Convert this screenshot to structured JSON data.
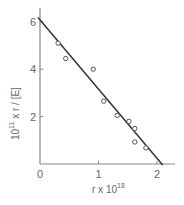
{
  "chart_data": {
    "type": "scatter",
    "title": "",
    "xlabel": "r x 10^18",
    "xlabel_main": "r x 10",
    "xlabel_sup": "18",
    "ylabel": "10^11 x r / [E]",
    "ylabel_pre": "10",
    "ylabel_sup": "11",
    "ylabel_post": " x r / [E]",
    "xlim": [
      0,
      2.3
    ],
    "ylim": [
      0,
      6.4
    ],
    "x_ticks": [
      0,
      1,
      2
    ],
    "x_tick_labels": [
      "0",
      "1",
      "2"
    ],
    "y_ticks": [
      2,
      4,
      6
    ],
    "y_tick_labels": [
      "2",
      "4",
      "6"
    ],
    "grid": false,
    "legend": null,
    "series": [
      {
        "name": "data",
        "marker": "open-circle",
        "x": [
          0.31,
          0.44,
          0.91,
          1.09,
          1.32,
          1.52,
          1.62,
          1.62,
          1.81
        ],
        "y": [
          5.1,
          4.45,
          4.0,
          2.65,
          2.05,
          1.8,
          1.5,
          0.93,
          0.68
        ]
      },
      {
        "name": "fit",
        "type": "line",
        "x": [
          0,
          2.08
        ],
        "y": [
          6.1,
          0
        ]
      }
    ]
  },
  "colors": {
    "axis": "#888888",
    "line": "#333333",
    "marker": "#555555"
  }
}
